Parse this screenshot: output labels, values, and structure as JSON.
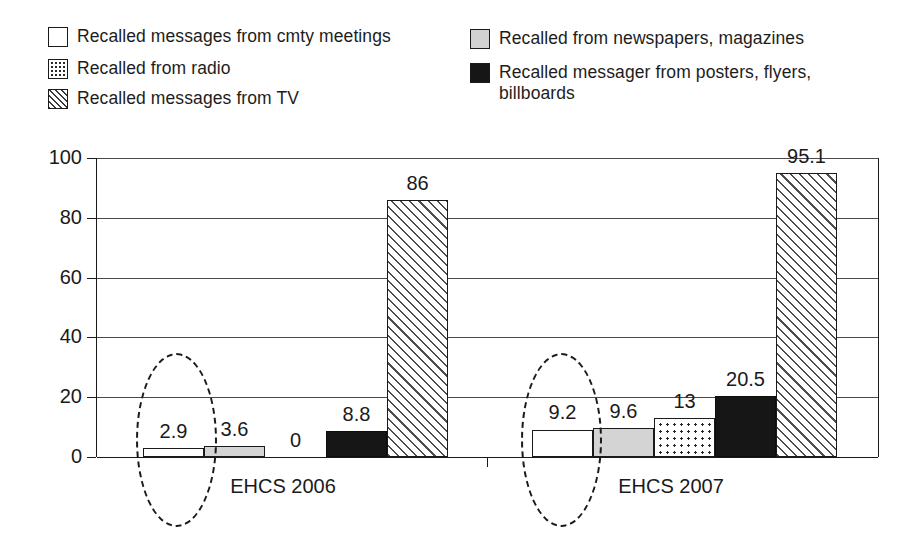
{
  "legend": {
    "left_column": [
      {
        "label": "Recalled messages from cmty meetings",
        "swatch": "white-square-icon",
        "pattern": "white"
      },
      {
        "label": "Recalled from radio",
        "swatch": "dotted-square-icon",
        "pattern": "dots"
      },
      {
        "label": "Recalled messages from TV",
        "swatch": "hatched-square-icon",
        "pattern": "hatch"
      }
    ],
    "right_column": [
      {
        "label": "Recalled from newspapers, magazines",
        "swatch": "gray-square-icon",
        "pattern": "gray"
      },
      {
        "label": "Recalled messager from posters, flyers,\nbillboards",
        "swatch": "black-square-icon",
        "pattern": "black"
      }
    ]
  },
  "chart_data": {
    "type": "bar",
    "title": "",
    "subtitle": "",
    "xlabel": "",
    "ylabel": "",
    "categories": [
      "EHCS 2006",
      "EHCS 2007"
    ],
    "ylim": [
      0,
      100
    ],
    "yticks": [
      0,
      20,
      40,
      60,
      80,
      100
    ],
    "ytick_labels": [
      "0",
      "20",
      "40",
      "60",
      "80",
      "100"
    ],
    "grid": true,
    "legend_position": "top",
    "series": [
      {
        "name": "Recalled messages from cmty meetings",
        "pattern": "white",
        "values": [
          2.9,
          9.2
        ],
        "labels": [
          "2.9",
          "9.2"
        ]
      },
      {
        "name": "Recalled from newspapers, magazines",
        "pattern": "gray",
        "values": [
          3.6,
          9.6
        ],
        "labels": [
          "3.6",
          "9.6"
        ]
      },
      {
        "name": "Recalled from radio",
        "pattern": "dots",
        "values": [
          0,
          13
        ],
        "labels": [
          "0",
          "13"
        ]
      },
      {
        "name": "Recalled messager from posters, flyers, billboards",
        "pattern": "black",
        "values": [
          8.8,
          20.5
        ],
        "labels": [
          "8.8",
          "20.5"
        ]
      },
      {
        "name": "Recalled messages from TV",
        "pattern": "hatch",
        "values": [
          86,
          95.1
        ],
        "labels": [
          "86",
          "95.1"
        ]
      }
    ],
    "annotations": [
      {
        "type": "dashed-ellipse",
        "target": "EHCS 2006 / Recalled messages from cmty meetings"
      },
      {
        "type": "dashed-ellipse",
        "target": "EHCS 2007 / Recalled messages from cmty meetings"
      }
    ]
  },
  "axis": {
    "y_labels": [
      "100",
      "80",
      "60",
      "40",
      "20",
      "0"
    ]
  },
  "x_axis": {
    "labels": [
      "EHCS 2006",
      "EHCS 2007"
    ]
  },
  "values_2006": {
    "cmty": "2.9",
    "news": "3.6",
    "radio": "0",
    "posters": "8.8",
    "tv": "86"
  },
  "values_2007": {
    "cmty": "9.2",
    "news": "9.6",
    "radio": "13",
    "posters": "20.5",
    "tv": "95.1"
  }
}
